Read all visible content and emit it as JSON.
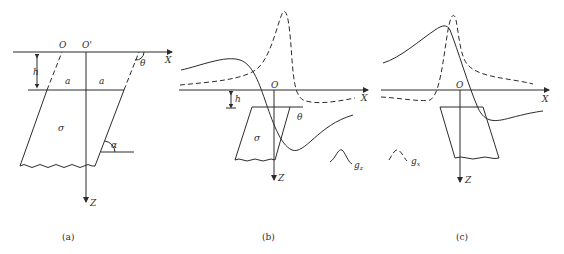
{
  "panel_a": {
    "caption": "(a)",
    "labels": {
      "origin": "O",
      "origin_prime": "O'",
      "x_axis": "X",
      "z_axis": "Z",
      "depth": "h",
      "half_width_left": "a",
      "half_width_right": "a",
      "density": "σ",
      "dip_angle": "α",
      "angle_theta": "θ"
    }
  },
  "panel_b": {
    "caption": "(b)",
    "labels": {
      "origin": "O",
      "x_axis": "X",
      "z_axis": "Z",
      "depth": "h",
      "density": "σ",
      "angle_theta": "θ"
    },
    "legend": {
      "symbol": "g",
      "subscript": "z",
      "line_style": "solid"
    }
  },
  "panel_c": {
    "caption": "(c)",
    "labels": {
      "origin": "O",
      "x_axis": "X",
      "z_axis": "Z"
    },
    "legend": {
      "symbol": "g",
      "subscript": "x",
      "line_style": "dashed"
    }
  },
  "colors": {
    "stroke": "#2b2b2b",
    "background": "#ffffff"
  }
}
